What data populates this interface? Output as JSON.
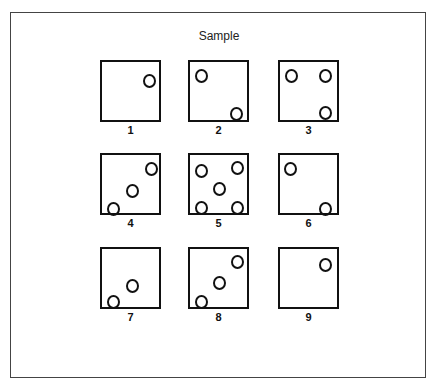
{
  "title": "Sample",
  "items": [
    {
      "label": "1",
      "x": 100,
      "y": 60,
      "dots": [
        [
          48,
          19
        ]
      ]
    },
    {
      "label": "2",
      "x": 188,
      "y": 60,
      "dots": [
        [
          12,
          14
        ],
        [
          47,
          52
        ]
      ]
    },
    {
      "label": "3",
      "x": 278,
      "y": 60,
      "dots": [
        [
          12,
          14
        ],
        [
          46,
          14
        ],
        [
          46,
          51
        ]
      ]
    },
    {
      "label": "4",
      "x": 100,
      "y": 153,
      "dots": [
        [
          50,
          14
        ],
        [
          31,
          36
        ],
        [
          12,
          54
        ]
      ]
    },
    {
      "label": "5",
      "x": 188,
      "y": 153,
      "dots": [
        [
          12,
          16
        ],
        [
          48,
          13
        ],
        [
          30,
          34
        ],
        [
          12,
          53
        ],
        [
          48,
          53
        ]
      ]
    },
    {
      "label": "6",
      "x": 278,
      "y": 153,
      "dots": [
        [
          11,
          14
        ],
        [
          46,
          54
        ]
      ]
    },
    {
      "label": "7",
      "x": 100,
      "y": 247,
      "dots": [
        [
          31,
          37
        ],
        [
          12,
          53
        ]
      ]
    },
    {
      "label": "8",
      "x": 188,
      "y": 247,
      "dots": [
        [
          48,
          13
        ],
        [
          30,
          34
        ],
        [
          12,
          53
        ]
      ]
    },
    {
      "label": "9",
      "x": 278,
      "y": 247,
      "dots": [
        [
          46,
          16
        ]
      ]
    }
  ]
}
